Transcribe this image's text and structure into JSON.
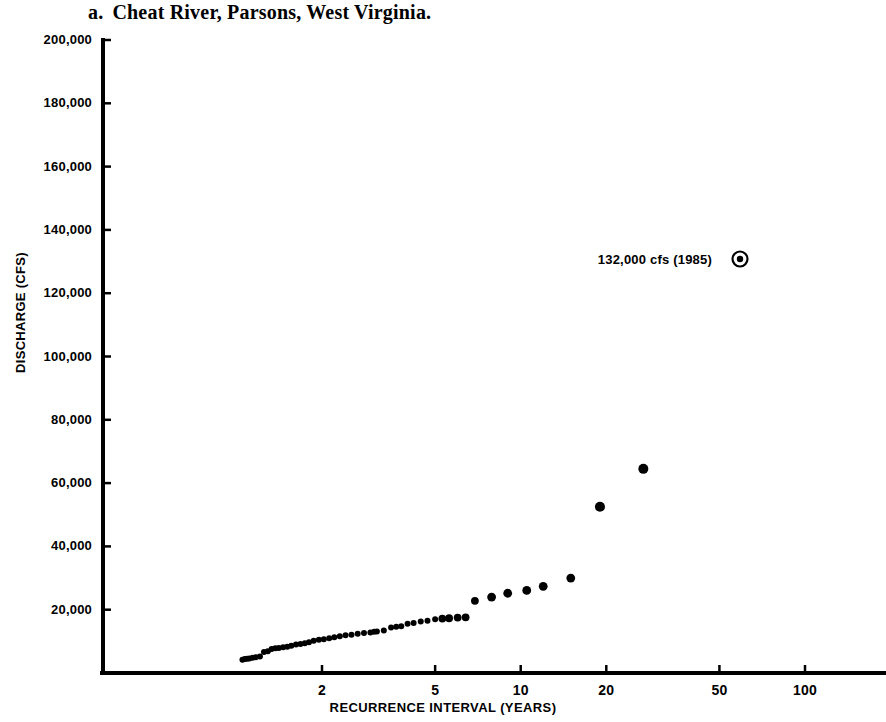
{
  "title": {
    "letter": "a.",
    "text": "Cheat River, Parsons, West Virginia."
  },
  "chart_data": {
    "type": "scatter",
    "xlabel": "RECURRENCE INTERVAL (YEARS)",
    "ylabel": "DISCHARGE (CFS)",
    "xscale": "log",
    "yscale": "linear",
    "xlim": [
      1.01,
      160
    ],
    "ylim": [
      0,
      200000
    ],
    "grid": false,
    "legend": "none",
    "xticks": [
      2,
      5,
      10,
      20,
      50,
      100
    ],
    "xtick_labels": [
      "2",
      "5",
      "10",
      "20",
      "50",
      "100"
    ],
    "yticks": [
      20000,
      40000,
      60000,
      80000,
      100000,
      120000,
      140000,
      160000,
      180000,
      200000
    ],
    "ytick_labels": [
      "20,000",
      "40,000",
      "60,000",
      "80,000",
      "100,000",
      "120,000",
      "140,000",
      "160,000",
      "180,000",
      "200,000"
    ],
    "series": [
      {
        "name": "Annual peak discharge",
        "marker": "filled-circle",
        "color": "#000000",
        "points": [
          [
            1.05,
            4200
          ],
          [
            1.07,
            4400
          ],
          [
            1.09,
            4500
          ],
          [
            1.11,
            4600
          ],
          [
            1.14,
            4800
          ],
          [
            1.17,
            5000
          ],
          [
            1.21,
            5200
          ],
          [
            1.25,
            6600
          ],
          [
            1.29,
            6900
          ],
          [
            1.33,
            7600
          ],
          [
            1.37,
            7800
          ],
          [
            1.41,
            7900
          ],
          [
            1.46,
            8100
          ],
          [
            1.51,
            8300
          ],
          [
            1.56,
            8600
          ],
          [
            1.62,
            9000
          ],
          [
            1.68,
            9200
          ],
          [
            1.74,
            9400
          ],
          [
            1.8,
            9700
          ],
          [
            1.87,
            10200
          ],
          [
            1.95,
            10500
          ],
          [
            2.03,
            10700
          ],
          [
            2.12,
            11000
          ],
          [
            2.21,
            11300
          ],
          [
            2.31,
            11600
          ],
          [
            2.42,
            11900
          ],
          [
            2.54,
            12100
          ],
          [
            2.67,
            12400
          ],
          [
            2.81,
            12600
          ],
          [
            2.96,
            12800
          ],
          [
            3.05,
            13000
          ],
          [
            3.12,
            13100
          ],
          [
            3.3,
            13400
          ],
          [
            3.5,
            14400
          ],
          [
            3.65,
            14600
          ],
          [
            3.8,
            14800
          ],
          [
            4.0,
            15600
          ],
          [
            4.2,
            15800
          ],
          [
            4.45,
            16300
          ],
          [
            4.7,
            16500
          ],
          [
            5.0,
            17000
          ],
          [
            5.3,
            17200
          ],
          [
            5.6,
            17300
          ],
          [
            6.0,
            17500
          ],
          [
            6.4,
            17600
          ],
          [
            6.9,
            22800
          ],
          [
            7.9,
            24000
          ],
          [
            9.0,
            25200
          ],
          [
            10.5,
            26100
          ],
          [
            12.0,
            27400
          ],
          [
            15.0,
            30000
          ],
          [
            19.0,
            52500
          ],
          [
            27.0,
            64500
          ]
        ]
      }
    ],
    "annotations": [
      {
        "label": "132,000 cfs (1985)",
        "marker": "bullseye-circle",
        "value": 132000,
        "year": 1985,
        "x_px": 740,
        "y_px": 259
      }
    ],
    "axis_color": "#000000"
  },
  "axes": {
    "x_label": "RECURRENCE INTERVAL (YEARS)",
    "y_label": "DISCHARGE (CFS)"
  }
}
